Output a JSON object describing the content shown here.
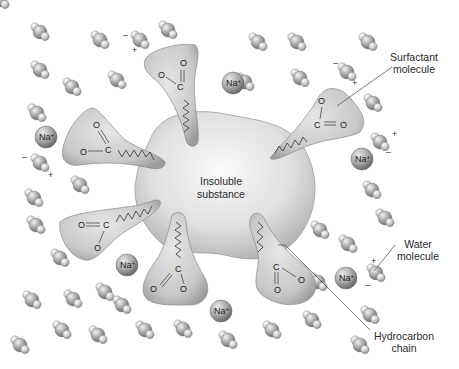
{
  "diagram": {
    "center_label_line1": "Insoluble",
    "center_label_line2": "substance",
    "callouts": {
      "surfactant_line1": "Surfactant",
      "surfactant_line2": "molecule",
      "water_line1": "Water",
      "water_line2": "molecule",
      "hydrocarbon_line1": "Hydrocarbon",
      "hydrocarbon_line2": "chain"
    },
    "ion_label": "Na",
    "ion_charge": "+",
    "plus_sign": "+",
    "minus_sign": "–",
    "carboxylate": {
      "oxygen": "O",
      "carbon": "C",
      "charge": "-"
    },
    "ions": [
      {
        "x": 233,
        "y": 83
      },
      {
        "x": 46,
        "y": 137
      },
      {
        "x": 362,
        "y": 159
      },
      {
        "x": 127,
        "y": 265
      },
      {
        "x": 346,
        "y": 278
      },
      {
        "x": 221,
        "y": 311
      }
    ],
    "surfactant_count": 7,
    "colors": {
      "background": "#ffffff",
      "blob_fill": "#dcdcdc",
      "blob_stroke": "#8a8a8a",
      "surfactant_fill": "#c9c9c9",
      "water_fill": "#a8a8a8",
      "line": "#444444"
    }
  }
}
